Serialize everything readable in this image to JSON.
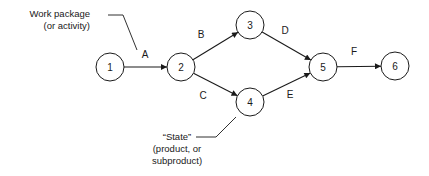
{
  "diagram": {
    "type": "activity-on-arrow network",
    "nodes": [
      {
        "id": "1",
        "label": "1",
        "x": 110,
        "y": 67
      },
      {
        "id": "2",
        "label": "2",
        "x": 181,
        "y": 67
      },
      {
        "id": "3",
        "label": "3",
        "x": 250,
        "y": 25
      },
      {
        "id": "4",
        "label": "4",
        "x": 250,
        "y": 102
      },
      {
        "id": "5",
        "label": "5",
        "x": 323,
        "y": 67
      },
      {
        "id": "6",
        "label": "6",
        "x": 395,
        "y": 66
      }
    ],
    "edges": [
      {
        "from": "1",
        "to": "2",
        "label": "A",
        "lx": 145,
        "ly": 58
      },
      {
        "from": "2",
        "to": "3",
        "label": "B",
        "lx": 201,
        "ly": 38
      },
      {
        "from": "2",
        "to": "4",
        "label": "C",
        "lx": 203,
        "ly": 99
      },
      {
        "from": "3",
        "to": "5",
        "label": "D",
        "lx": 285,
        "ly": 34
      },
      {
        "from": "4",
        "to": "5",
        "label": "E",
        "lx": 290,
        "ly": 98
      },
      {
        "from": "5",
        "to": "6",
        "label": "F",
        "lx": 354,
        "ly": 55
      }
    ],
    "annotations": [
      {
        "lines": [
          "Work package",
          "(or activity)"
        ],
        "target": "edge A"
      },
      {
        "lines": [
          "“State”",
          "(product, or",
          "subproduct)"
        ],
        "target": "node 4"
      }
    ]
  }
}
